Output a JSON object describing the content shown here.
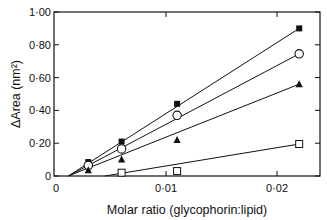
{
  "chart_data": {
    "type": "scatter",
    "title": "",
    "xlabel": "Molar ratio (glycophorin:lipid)",
    "ylabel": "ΔArea (nm²)",
    "xlim": [
      0,
      0.024
    ],
    "ylim": [
      0,
      1.0
    ],
    "x_ticks": [
      0,
      0.01,
      0.02
    ],
    "x_tick_labels": [
      "0",
      "0·01",
      "0·02"
    ],
    "y_ticks": [
      0,
      0.2,
      0.4,
      0.6,
      0.8,
      1.0
    ],
    "y_tick_labels": [
      "0",
      "0·20",
      "0·40",
      "0·60",
      "0·80",
      "1·00"
    ],
    "grid": false,
    "legend": "none",
    "fit_lines": "linear, extrapolating to x-intercept ≈ 0.0013",
    "series": [
      {
        "name": "filled-square",
        "marker": "filled-square",
        "x": [
          0.003,
          0.006,
          0.011,
          0.022
        ],
        "y": [
          0.085,
          0.21,
          0.44,
          0.9
        ]
      },
      {
        "name": "open-circle",
        "marker": "open-circle",
        "x": [
          0.003,
          0.006,
          0.011,
          0.022
        ],
        "y": [
          0.065,
          0.165,
          0.37,
          0.745
        ]
      },
      {
        "name": "filled-triangle",
        "marker": "filled-triangle",
        "x": [
          0.003,
          0.006,
          0.011,
          0.022
        ],
        "y": [
          0.035,
          0.1,
          0.22,
          0.56
        ]
      },
      {
        "name": "open-square",
        "marker": "open-square",
        "x": [
          0.006,
          0.011,
          0.022
        ],
        "y": [
          0.02,
          0.03,
          0.195
        ]
      }
    ]
  }
}
